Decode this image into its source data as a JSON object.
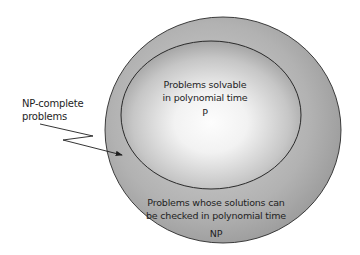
{
  "diagram": {
    "type": "set-inclusion (Euler) diagram",
    "outer_set": {
      "name": "NP",
      "description_line1": "Problems whose solutions can",
      "description_line2": "be checked in polynomial time",
      "label": "NP",
      "fill_color": "#9f9f9f"
    },
    "inner_set": {
      "name": "P",
      "description_line1": "Problems solvable",
      "description_line2": "in polynomial time",
      "label": "P",
      "fill_center_color": "#fbfbfb",
      "fill_edge_color": "#9a9a9a"
    },
    "callout": {
      "line1": "NP-complete",
      "line2": "problems",
      "points_to": "region of NP outside P (boundary band)"
    },
    "stroke_color": "#2a2a2a"
  }
}
